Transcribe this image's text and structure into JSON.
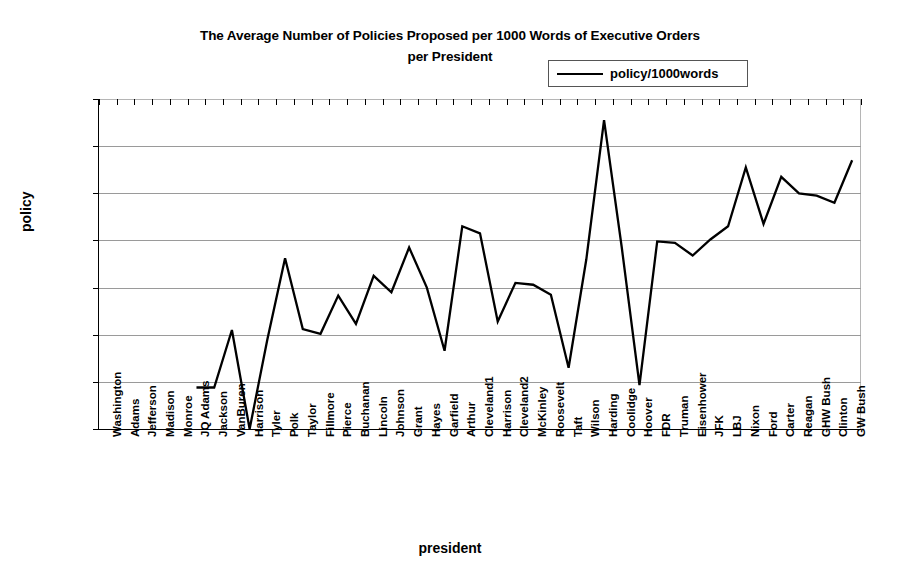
{
  "chart": {
    "title_line1": "The Average Number of Policies Proposed per 1000 Words of Executive Orders",
    "title_line2": "per President",
    "legend_label": "policy/1000words",
    "x_axis_title": "president",
    "y_axis_title": "policy",
    "line_color": "#000000",
    "gridline_color": "#9a9a9a",
    "axis_color": "#000000"
  },
  "chart_data": {
    "type": "line",
    "title": "The Average Number of Policies Proposed per 1000 Words of Executive Orders per President",
    "xlabel": "president",
    "ylabel": "policy",
    "ylim": [
      0,
      70
    ],
    "ytick_values": [
      0,
      10,
      20,
      30,
      40,
      50,
      60,
      70
    ],
    "grid": true,
    "legend_position": "top-right",
    "categories": [
      "Washington",
      "Adams",
      "Jefferson",
      "Madison",
      "Monroe",
      "JQ Adams",
      "Jackson",
      "VanBuren",
      "Harrison",
      "Tyler",
      "Polk",
      "Taylor",
      "Fillmore",
      "Pierce",
      "Buchanan",
      "Lincoln",
      "Johnson",
      "Grant",
      "Hayes",
      "Garfield",
      "Arthur",
      "Cleveland1",
      "Harrison",
      "Cleveland2",
      "McKinley",
      "Roosevelt",
      "Taft",
      "Wilson",
      "Harding",
      "Coolidge",
      "Hoover",
      "FDR",
      "Truman",
      "Eisenhower",
      "JFK",
      "LBJ",
      "Nixon",
      "Ford",
      "Carter",
      "Reagan",
      "GHW Bush",
      "Clinton",
      "GW Bush"
    ],
    "series": [
      {
        "name": "policy/1000words",
        "values": [
          null,
          null,
          null,
          null,
          null,
          8.8,
          8.8,
          21.0,
          0.0,
          19.0,
          36.2,
          21.2,
          20.2,
          28.3,
          22.3,
          32.5,
          29.0,
          38.5,
          30.0,
          16.6,
          43.0,
          41.5,
          22.8,
          31.0,
          30.6,
          28.5,
          13.0,
          36.0,
          65.5,
          38.5,
          9.3,
          39.8,
          39.5,
          36.8,
          40.2,
          43.0,
          55.5,
          43.5,
          53.5,
          50.0,
          49.5,
          48.0,
          57.0
        ]
      }
    ]
  }
}
